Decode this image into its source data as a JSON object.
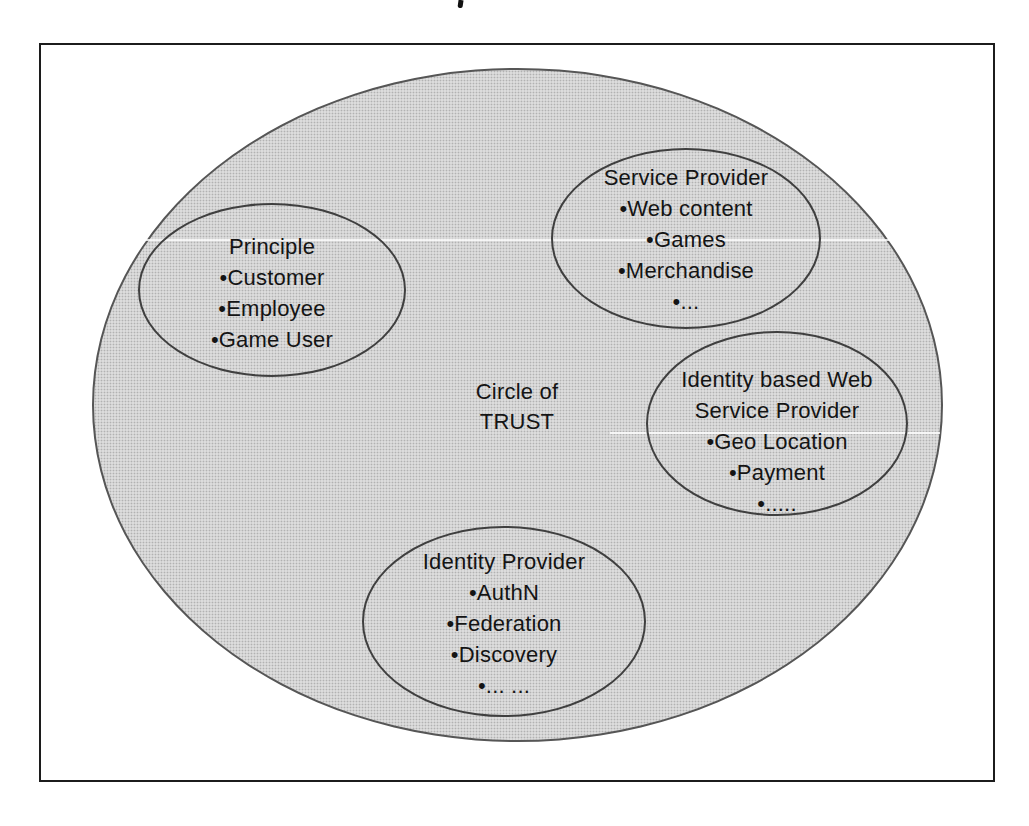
{
  "diagram": {
    "kind": "circle-of-trust-venn-diagram",
    "center_label": {
      "line1": "Circle of",
      "line2": "TRUST"
    },
    "groups": [
      {
        "name": "principle",
        "title_lines": [
          "Principle"
        ],
        "items": [
          "•Customer",
          "•Employee",
          "•Game User"
        ]
      },
      {
        "name": "service-provider",
        "title_lines": [
          "Service Provider"
        ],
        "items": [
          "•Web content",
          "•Games",
          "•Merchandise",
          "•..."
        ]
      },
      {
        "name": "identity-based-web-service-provider",
        "title_lines": [
          "Identity based Web",
          "Service Provider"
        ],
        "items": [
          "•Geo Location",
          "•Payment",
          "•....."
        ]
      },
      {
        "name": "identity-provider",
        "title_lines": [
          "Identity Provider"
        ],
        "items": [
          "•AuthN",
          "•Federation",
          "•Discovery",
          "•... ..."
        ]
      }
    ],
    "colors": {
      "ellipse_fill": "#dcdcdc",
      "ellipse_stroke": "#474747",
      "frame_stroke": "#1c1c1c",
      "text": "#141414",
      "background": "#ffffff"
    }
  }
}
